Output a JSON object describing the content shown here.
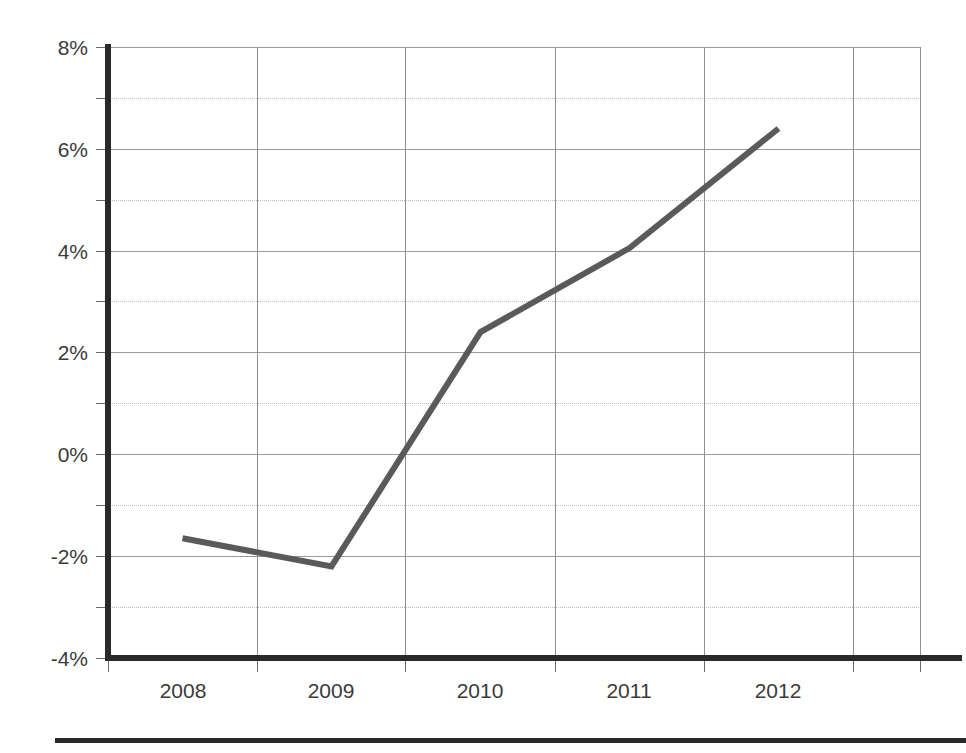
{
  "chart_data": {
    "type": "line",
    "title": "",
    "subtitle": "",
    "xlabel": "",
    "ylabel": "",
    "categories": [
      "2008",
      "2009",
      "2010",
      "2011",
      "2012"
    ],
    "x": [
      2008,
      2009,
      2010,
      2011,
      2012
    ],
    "values": [
      -1.65,
      -2.2,
      2.4,
      4.05,
      6.4
    ],
    "series": [
      {
        "name": "",
        "values": [
          -1.65,
          -2.2,
          2.4,
          4.05,
          6.4
        ]
      }
    ],
    "ylim": [
      -4,
      8
    ],
    "y_major_ticks": [
      8,
      6,
      4,
      2,
      0,
      -2,
      -4
    ],
    "y_major_tick_labels": [
      "8%",
      "6%",
      "4%",
      "2%",
      "0%",
      "-2%",
      "-4%"
    ],
    "y_minor_ticks": [
      7,
      5,
      3,
      1,
      -1,
      -3
    ],
    "x_tick_labels": [
      "2008",
      "2009",
      "2010",
      "2011",
      "2012"
    ],
    "grid": true,
    "grid_axes": "both",
    "legend": "none",
    "legend_position": "none",
    "annotations": [],
    "value_format": "percent",
    "line_color": "#5a5a5a",
    "axis_color": "#2a2a2a",
    "grid_color": "#9a9a9a",
    "background_color": "#ffffff"
  },
  "axis": {
    "y_labels": [
      "8%",
      "6%",
      "4%",
      "2%",
      "0%",
      "-2%",
      "-4%"
    ],
    "x_labels": [
      "2008",
      "2009",
      "2010",
      "2011",
      "2012"
    ]
  },
  "footer": {
    "rule_visible": "true"
  }
}
